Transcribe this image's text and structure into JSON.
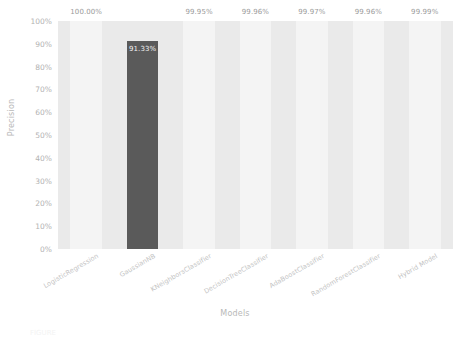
{
  "chart_data": {
    "type": "bar",
    "title": "",
    "xlabel": "Models",
    "ylabel": "Precision",
    "categories": [
      "LogisticRegression",
      "GaussianNB",
      "KNeighborsClassifier",
      "DecisionTreeClassifier",
      "AdaBoostClassifier",
      "RandomForestClassifier",
      "Hybrid Model"
    ],
    "values": [
      100.0,
      91.33,
      99.95,
      99.96,
      99.97,
      99.96,
      99.99
    ],
    "value_labels": [
      "100.00%",
      "91.33%",
      "99.95%",
      "99.96%",
      "99.97%",
      "99.96%",
      "99.99%"
    ],
    "bar_colors": [
      "#f4f4f4",
      "#5a5a5a",
      "#f4f4f4",
      "#f4f4f4",
      "#f4f4f4",
      "#f4f4f4",
      "#f4f4f4"
    ],
    "ylim": [
      0,
      100
    ],
    "ytick_labels": [
      "0%",
      "10%",
      "20%",
      "30%",
      "40%",
      "50%",
      "60%",
      "70%",
      "80%",
      "90%",
      "100%"
    ],
    "ytick_values": [
      0,
      10,
      20,
      30,
      40,
      50,
      60,
      70,
      80,
      90,
      100
    ],
    "grid": false,
    "legend": "none",
    "plot_background": "#eaeaea",
    "figure_background": "#ffffff",
    "tick_color": "#b2b2b2",
    "highlight_color": "#5a5a5a"
  },
  "caption": {
    "text": "FIGURE"
  }
}
